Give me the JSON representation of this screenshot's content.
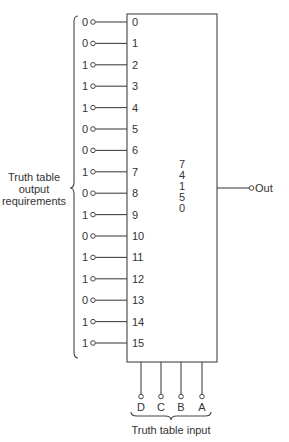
{
  "mux": {
    "chip_label_lines": [
      "7",
      "4",
      "1",
      "5",
      "0"
    ],
    "output_label": "Out",
    "inputs": [
      {
        "index": "0",
        "value": "0"
      },
      {
        "index": "1",
        "value": "0"
      },
      {
        "index": "2",
        "value": "1"
      },
      {
        "index": "3",
        "value": "1"
      },
      {
        "index": "4",
        "value": "1"
      },
      {
        "index": "5",
        "value": "0"
      },
      {
        "index": "6",
        "value": "0"
      },
      {
        "index": "7",
        "value": "1"
      },
      {
        "index": "8",
        "value": "0"
      },
      {
        "index": "9",
        "value": "1"
      },
      {
        "index": "10",
        "value": "0"
      },
      {
        "index": "11",
        "value": "1"
      },
      {
        "index": "12",
        "value": "1"
      },
      {
        "index": "13",
        "value": "0"
      },
      {
        "index": "14",
        "value": "1"
      },
      {
        "index": "15",
        "value": "1"
      }
    ],
    "select_lines": [
      "D",
      "C",
      "B",
      "A"
    ]
  },
  "labels": {
    "output_requirements_lines": [
      "Truth table",
      "output",
      "requirements"
    ],
    "truth_table_input": "Truth table input"
  }
}
